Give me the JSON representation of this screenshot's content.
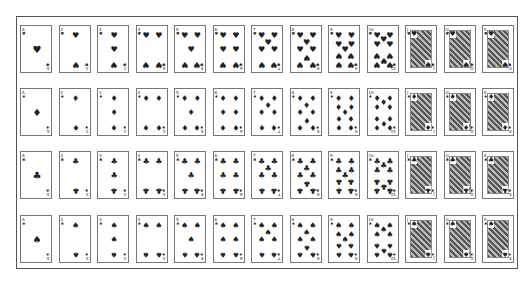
{
  "layout": {
    "columns": 13,
    "rows": 4,
    "card_width": 32,
    "card_height": 48,
    "col_x": [
      20,
      58.5,
      97,
      135.5,
      174,
      212.5,
      251,
      289.5,
      328,
      366.5,
      405,
      443.5,
      482
    ],
    "row_y": [
      25,
      88,
      151,
      215
    ]
  },
  "ranks": [
    "A",
    "2",
    "3",
    "4",
    "5",
    "6",
    "7",
    "8",
    "9",
    "10",
    "J",
    "Q",
    "K"
  ],
  "suits": [
    {
      "name": "hearts",
      "symbol": "♥",
      "color": "#222222"
    },
    {
      "name": "diamonds",
      "symbol": "♦",
      "color": "#222222"
    },
    {
      "name": "clubs",
      "symbol": "♣",
      "color": "#222222"
    },
    {
      "name": "spades",
      "symbol": "♠",
      "color": "#222222"
    }
  ],
  "colors": {
    "frame": "#555555",
    "card_border": "#777777",
    "ink": "#222222",
    "background": "#ffffff"
  }
}
